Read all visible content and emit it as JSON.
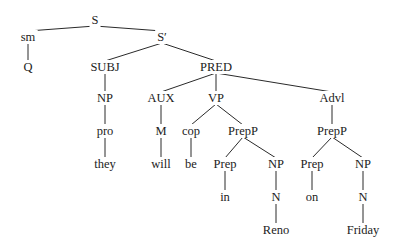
{
  "diagram": {
    "type": "syntax-tree",
    "nodes": [
      {
        "id": "S",
        "label": "S",
        "x": 95,
        "y": 20
      },
      {
        "id": "sm",
        "label": "sm",
        "x": 28,
        "y": 37
      },
      {
        "id": "Q",
        "label": "Q",
        "x": 28,
        "y": 67
      },
      {
        "id": "Sbar",
        "label": "S′",
        "x": 162,
        "y": 37
      },
      {
        "id": "SUBJ",
        "label": "SUBJ",
        "x": 105,
        "y": 67
      },
      {
        "id": "PRED",
        "label": "PRED",
        "x": 216,
        "y": 67
      },
      {
        "id": "NP0",
        "label": "NP",
        "x": 105,
        "y": 98
      },
      {
        "id": "AUX",
        "label": "AUX",
        "x": 161,
        "y": 98
      },
      {
        "id": "VP",
        "label": "VP",
        "x": 216,
        "y": 98
      },
      {
        "id": "Advl",
        "label": "Advl",
        "x": 332,
        "y": 98
      },
      {
        "id": "pro",
        "label": "pro",
        "x": 105,
        "y": 131
      },
      {
        "id": "M",
        "label": "M",
        "x": 161,
        "y": 131
      },
      {
        "id": "cop",
        "label": "cop",
        "x": 191,
        "y": 131
      },
      {
        "id": "PrepP1",
        "label": "PrepP",
        "x": 243,
        "y": 131
      },
      {
        "id": "PrepP2",
        "label": "PrepP",
        "x": 332,
        "y": 131
      },
      {
        "id": "they",
        "label": "they",
        "x": 105,
        "y": 164
      },
      {
        "id": "will",
        "label": "will",
        "x": 161,
        "y": 164
      },
      {
        "id": "be",
        "label": "be",
        "x": 191,
        "y": 164
      },
      {
        "id": "Prep1",
        "label": "Prep",
        "x": 225,
        "y": 164
      },
      {
        "id": "NP1",
        "label": "NP",
        "x": 276,
        "y": 164
      },
      {
        "id": "Prep2",
        "label": "Prep",
        "x": 312,
        "y": 164
      },
      {
        "id": "NP2",
        "label": "NP",
        "x": 363,
        "y": 164
      },
      {
        "id": "in",
        "label": "in",
        "x": 225,
        "y": 197
      },
      {
        "id": "N1",
        "label": "N",
        "x": 276,
        "y": 197
      },
      {
        "id": "on",
        "label": "on",
        "x": 312,
        "y": 197
      },
      {
        "id": "N2",
        "label": "N",
        "x": 363,
        "y": 197
      },
      {
        "id": "Reno",
        "label": "Reno",
        "x": 276,
        "y": 230
      },
      {
        "id": "Friday",
        "label": "Friday",
        "x": 363,
        "y": 230
      }
    ],
    "edges": [
      [
        "S",
        "sm"
      ],
      [
        "S",
        "Sbar"
      ],
      [
        "sm",
        "Q"
      ],
      [
        "Sbar",
        "SUBJ"
      ],
      [
        "Sbar",
        "PRED"
      ],
      [
        "SUBJ",
        "NP0"
      ],
      [
        "NP0",
        "pro"
      ],
      [
        "pro",
        "they"
      ],
      [
        "PRED",
        "AUX"
      ],
      [
        "PRED",
        "VP"
      ],
      [
        "PRED",
        "Advl"
      ],
      [
        "AUX",
        "M"
      ],
      [
        "M",
        "will"
      ],
      [
        "VP",
        "cop"
      ],
      [
        "VP",
        "PrepP1"
      ],
      [
        "cop",
        "be"
      ],
      [
        "PrepP1",
        "Prep1"
      ],
      [
        "PrepP1",
        "NP1"
      ],
      [
        "Prep1",
        "in"
      ],
      [
        "NP1",
        "N1"
      ],
      [
        "N1",
        "Reno"
      ],
      [
        "Advl",
        "PrepP2"
      ],
      [
        "PrepP2",
        "Prep2"
      ],
      [
        "PrepP2",
        "NP2"
      ],
      [
        "Prep2",
        "on"
      ],
      [
        "NP2",
        "N2"
      ],
      [
        "N2",
        "Friday"
      ]
    ]
  },
  "sentence": [
    "Q",
    "they",
    "will",
    "be",
    "in",
    "Reno",
    "on",
    "Friday"
  ]
}
